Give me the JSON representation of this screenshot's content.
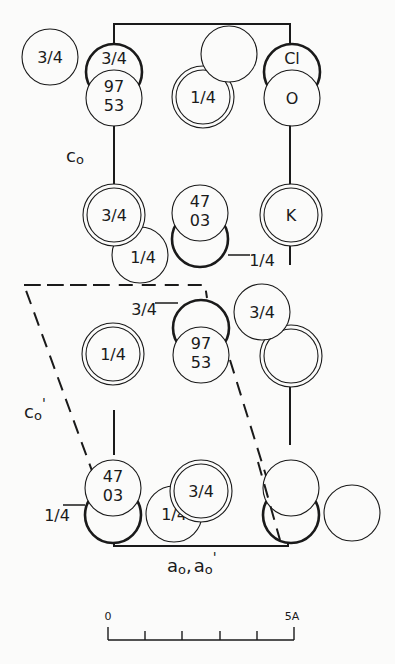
{
  "figure": {
    "type": "crystal-structure-projection",
    "axis_labels": {
      "c0": "c",
      "c0_sub": "o",
      "c0_prime": "c",
      "c0_prime_sub": "o",
      "c0_prime_mark": "'",
      "a0": "a",
      "a0_sub": "o",
      "a0_sep": ",",
      "a0_prime": "a",
      "a0_prime_sub": "o",
      "a0_prime_mark": "'"
    },
    "legend_atoms": {
      "cl": "Cl",
      "o": "O",
      "k": "K"
    },
    "atoms": [
      {
        "id": "a1",
        "label": "3/4",
        "style": "thin"
      },
      {
        "id": "a2",
        "label": "3/4",
        "style": "bold"
      },
      {
        "id": "a3",
        "label_top": "97",
        "label_bottom": "53",
        "style": "thin"
      },
      {
        "id": "a4",
        "label": "",
        "style": "thin"
      },
      {
        "id": "a5",
        "label": "1/4",
        "style": "double"
      },
      {
        "id": "a6",
        "label": "Cl",
        "style": "bold"
      },
      {
        "id": "a7",
        "label": "O",
        "style": "thin"
      },
      {
        "id": "a8",
        "label": "3/4",
        "style": "double"
      },
      {
        "id": "a9",
        "label_top": "47",
        "label_bottom": "03",
        "style": "thin"
      },
      {
        "id": "a10",
        "label": "K",
        "style": "double"
      },
      {
        "id": "a11",
        "label": "1/4",
        "style": "thin"
      },
      {
        "id": "a12",
        "label": "1/4",
        "style": "bold"
      },
      {
        "id": "a13",
        "label": "3/4",
        "style": "bold"
      },
      {
        "id": "a14",
        "label_top": "97",
        "label_bottom": "53",
        "style": "thin"
      },
      {
        "id": "a15",
        "label": "3/4",
        "style": "thin"
      },
      {
        "id": "a16",
        "label": "",
        "style": "double"
      },
      {
        "id": "a17",
        "label": "1/4",
        "style": "double"
      },
      {
        "id": "a18",
        "label_top": "47",
        "label_bottom": "03",
        "style": "thin"
      },
      {
        "id": "a19",
        "label": "1/4",
        "style": "bold"
      },
      {
        "id": "a20",
        "label": "3/4",
        "style": "double"
      },
      {
        "id": "a21",
        "label": "1/4",
        "style": "thin"
      },
      {
        "id": "a22",
        "label": "",
        "style": "thin"
      },
      {
        "id": "a23",
        "label": "",
        "style": "bold"
      },
      {
        "id": "a24",
        "label": "",
        "style": "thin"
      }
    ],
    "scale_bar": {
      "start_label": "0",
      "end_label": "5A",
      "ticks": 6
    }
  }
}
